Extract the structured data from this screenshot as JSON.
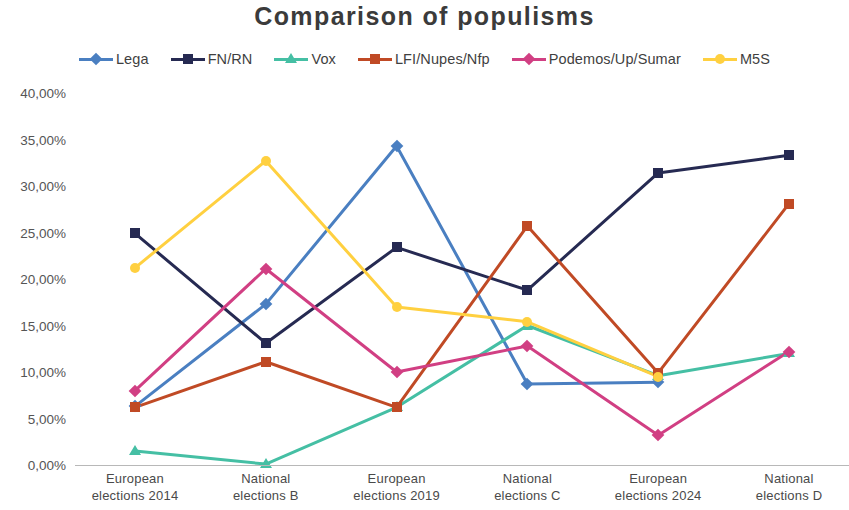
{
  "chart": {
    "title": "Comparison of populisms"
  },
  "legend": {
    "position": "top",
    "items": [
      {
        "label": "Lega",
        "color": "#4a7fc1",
        "marker": "diamond"
      },
      {
        "label": "FN/RN",
        "color": "#262a52",
        "marker": "square"
      },
      {
        "label": "Vox",
        "color": "#45bfa4",
        "marker": "triangle"
      },
      {
        "label": "LFI/Nupes/Nfp",
        "color": "#c04a25",
        "marker": "square"
      },
      {
        "label": "Podemos/Up/Sumar",
        "color": "#d13f83",
        "marker": "diamond"
      },
      {
        "label": "M5S",
        "color": "#ffd040",
        "marker": "circle"
      }
    ]
  },
  "axes": {
    "y_ticks": [
      "0,00%",
      "5,00%",
      "10,00%",
      "15,00%",
      "20,00%",
      "25,00%",
      "30,00%",
      "35,00%",
      "40,00%"
    ],
    "x_ticks": [
      {
        "line1": "European",
        "line2": "elections 2014"
      },
      {
        "line1": "National",
        "line2": "elections B"
      },
      {
        "line1": "European",
        "line2": "elections 2019"
      },
      {
        "line1": "National",
        "line2": "elections C"
      },
      {
        "line1": "European",
        "line2": "elections 2024"
      },
      {
        "line1": "National",
        "line2": "elections D"
      }
    ]
  },
  "chart_data": {
    "type": "line",
    "title": "Comparison of populisms",
    "xlabel": "",
    "ylabel": "",
    "ylim": [
      0,
      40
    ],
    "ytick_step": 5,
    "ytick_format": "percent_comma",
    "grid": false,
    "legend_position": "top",
    "categories": [
      "European elections 2014",
      "National elections B",
      "European elections 2019",
      "National elections C",
      "European elections 2024",
      "National elections D"
    ],
    "series": [
      {
        "name": "Lega",
        "color": "#4a7fc1",
        "marker": "diamond",
        "values": [
          6.3,
          17.3,
          34.3,
          8.7,
          8.9,
          null
        ]
      },
      {
        "name": "FN/RN",
        "color": "#262a52",
        "marker": "square",
        "values": [
          24.9,
          13.1,
          23.4,
          18.8,
          31.4,
          33.3
        ]
      },
      {
        "name": "Vox",
        "color": "#45bfa4",
        "marker": "triangle",
        "values": [
          1.5,
          0.1,
          6.2,
          15.0,
          9.6,
          12.0
        ]
      },
      {
        "name": "LFI/Nupes/Nfp",
        "color": "#c04a25",
        "marker": "square",
        "values": [
          6.2,
          11.1,
          6.2,
          25.7,
          9.9,
          28.1
        ]
      },
      {
        "name": "Podemos/Up/Sumar",
        "color": "#d13f83",
        "marker": "diamond",
        "values": [
          8.0,
          21.1,
          10.0,
          12.8,
          3.2,
          12.2
        ]
      },
      {
        "name": "M5S",
        "color": "#ffd040",
        "marker": "circle",
        "values": [
          21.2,
          32.7,
          17.0,
          15.4,
          9.5,
          null
        ]
      }
    ]
  }
}
